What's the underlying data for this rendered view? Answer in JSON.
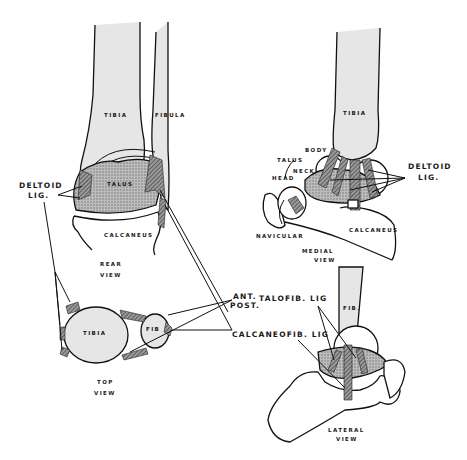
{
  "figure": {
    "views": {
      "rear": {
        "caption_line1": "REAR",
        "caption_line2": "VIEW",
        "labels": {
          "tibia": "TIBIA",
          "fibula": "FIBULA",
          "talus": "TALUS",
          "calcaneus": "CALCANEUS"
        }
      },
      "top": {
        "caption_line1": "TOP",
        "caption_line2": "VIEW",
        "labels": {
          "tibia": "TIBIA",
          "fibula": "FIB"
        }
      },
      "medial": {
        "caption_line1": "MEDIAL",
        "caption_line2": "VIEW",
        "labels": {
          "tibia": "TIBIA",
          "body": "BODY",
          "talus": "TALUS",
          "neck": "NECK",
          "head": "HEAD",
          "navicular": "NAVICULAR",
          "calcaneus": "CALCANEUS"
        }
      },
      "lateral": {
        "caption_line1": "LATERAL",
        "caption_line2": "VIEW",
        "labels": {
          "fibula": "FIB."
        }
      }
    },
    "callouts": {
      "deltoid_left_line1": "DELTOID",
      "deltoid_left_line2": "LIG.",
      "deltoid_right_line1": "DELTOID",
      "deltoid_right_line2": "LIG.",
      "ant": "ANT.",
      "post": "POST.",
      "talofib": "TALOFIB. LIG",
      "calcaneofib": "CALCANEOFIB. LIG"
    }
  }
}
